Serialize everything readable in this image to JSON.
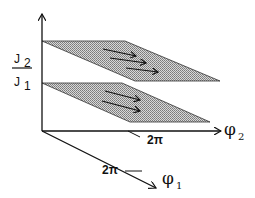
{
  "diagram": {
    "type": "3d-phase-space-sketch",
    "axes": {
      "vertical": {
        "label_numerator": "J",
        "numerator_sub": "2",
        "label_denominator": "J",
        "denominator_sub": "1"
      },
      "phi2": {
        "label": "φ",
        "sub": "2",
        "tick_label": "2π"
      },
      "phi1": {
        "label": "φ",
        "sub": "1",
        "tick_label": "2π"
      }
    },
    "planes": [
      {
        "name": "upper-plane",
        "arrow_count": 3
      },
      {
        "name": "lower-plane",
        "arrow_count": 2
      }
    ],
    "colors": {
      "line": "#111111",
      "plane_fill": "#b0b0b0"
    }
  }
}
